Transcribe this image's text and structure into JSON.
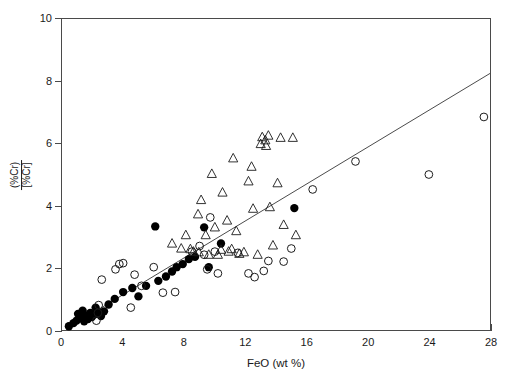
{
  "chart_data": {
    "type": "scatter",
    "title": "",
    "xlabel": "FeO (wt %)",
    "ylabel_numerator": "(%Cr)",
    "ylabel_denominator": "[%Cr]",
    "xlim": [
      0,
      28
    ],
    "ylim": [
      0,
      10
    ],
    "xticks": [
      0,
      4,
      8,
      12,
      16,
      20,
      24,
      28
    ],
    "yticks": [
      0,
      2,
      4,
      6,
      8,
      10
    ],
    "xticklabels": [
      "0",
      "4",
      "8",
      "12",
      "16",
      "20",
      "24",
      "28"
    ],
    "yticklabels": [
      "0",
      "2",
      "4",
      "6",
      "8",
      "10"
    ],
    "grid": false,
    "legend": "none",
    "series": [
      {
        "name": "filled-circle",
        "marker": "filled-circle",
        "color": "#000000",
        "points": [
          [
            0.45,
            0.12
          ],
          [
            0.75,
            0.22
          ],
          [
            0.95,
            0.3
          ],
          [
            1.05,
            0.52
          ],
          [
            1.25,
            0.38
          ],
          [
            1.35,
            0.62
          ],
          [
            1.45,
            0.28
          ],
          [
            1.55,
            0.46
          ],
          [
            1.7,
            0.35
          ],
          [
            1.85,
            0.55
          ],
          [
            1.95,
            0.42
          ],
          [
            2.1,
            0.5
          ],
          [
            2.2,
            0.72
          ],
          [
            2.35,
            0.58
          ],
          [
            2.55,
            0.45
          ],
          [
            2.75,
            0.6
          ],
          [
            3.05,
            0.82
          ],
          [
            3.45,
            1.0
          ],
          [
            4.0,
            1.22
          ],
          [
            4.6,
            1.35
          ],
          [
            5.0,
            1.08
          ],
          [
            5.5,
            1.42
          ],
          [
            6.1,
            3.33
          ],
          [
            6.3,
            1.58
          ],
          [
            6.8,
            1.72
          ],
          [
            7.2,
            1.88
          ],
          [
            7.5,
            2.02
          ],
          [
            7.9,
            2.12
          ],
          [
            8.3,
            2.28
          ],
          [
            8.7,
            2.35
          ],
          [
            9.3,
            3.3
          ],
          [
            9.6,
            2.02
          ],
          [
            10.4,
            2.78
          ],
          [
            15.2,
            3.92
          ]
        ]
      },
      {
        "name": "open-circle",
        "marker": "open-circle",
        "color": "#1a1a1a",
        "points": [
          [
            2.25,
            0.3
          ],
          [
            2.35,
            0.55
          ],
          [
            2.4,
            0.8
          ],
          [
            2.6,
            1.62
          ],
          [
            3.5,
            1.95
          ],
          [
            3.75,
            2.12
          ],
          [
            4.0,
            2.15
          ],
          [
            4.5,
            0.72
          ],
          [
            4.75,
            1.78
          ],
          [
            5.2,
            1.42
          ],
          [
            6.0,
            2.02
          ],
          [
            6.6,
            1.2
          ],
          [
            7.4,
            1.22
          ],
          [
            8.5,
            2.52
          ],
          [
            9.0,
            2.7
          ],
          [
            9.3,
            2.42
          ],
          [
            9.5,
            1.95
          ],
          [
            9.7,
            3.62
          ],
          [
            10.0,
            2.52
          ],
          [
            10.2,
            1.82
          ],
          [
            11.5,
            2.48
          ],
          [
            12.2,
            1.82
          ],
          [
            12.6,
            1.7
          ],
          [
            13.2,
            1.9
          ],
          [
            13.5,
            2.22
          ],
          [
            14.5,
            2.2
          ],
          [
            15.0,
            2.62
          ],
          [
            16.4,
            4.52
          ],
          [
            19.2,
            5.42
          ],
          [
            24.0,
            5.0
          ],
          [
            27.6,
            6.85
          ]
        ]
      },
      {
        "name": "open-triangle",
        "marker": "open-triangle",
        "color": "#1a1a1a",
        "points": [
          [
            7.2,
            2.78
          ],
          [
            7.8,
            2.62
          ],
          [
            8.1,
            3.05
          ],
          [
            8.4,
            2.6
          ],
          [
            8.6,
            2.52
          ],
          [
            8.9,
            3.72
          ],
          [
            8.95,
            2.5
          ],
          [
            9.1,
            4.18
          ],
          [
            9.4,
            3.05
          ],
          [
            9.6,
            2.42
          ],
          [
            9.8,
            5.02
          ],
          [
            10.0,
            3.3
          ],
          [
            10.2,
            2.42
          ],
          [
            10.4,
            2.58
          ],
          [
            10.5,
            4.42
          ],
          [
            10.8,
            3.52
          ],
          [
            10.9,
            2.52
          ],
          [
            11.1,
            2.6
          ],
          [
            11.2,
            5.52
          ],
          [
            11.4,
            3.18
          ],
          [
            11.6,
            2.45
          ],
          [
            11.9,
            2.5
          ],
          [
            12.2,
            4.78
          ],
          [
            12.4,
            5.25
          ],
          [
            12.5,
            3.9
          ],
          [
            12.8,
            2.42
          ],
          [
            13.0,
            5.98
          ],
          [
            13.1,
            6.2
          ],
          [
            13.3,
            6.1
          ],
          [
            13.35,
            5.92
          ],
          [
            13.5,
            6.25
          ],
          [
            13.6,
            3.95
          ],
          [
            13.8,
            2.72
          ],
          [
            14.1,
            4.72
          ],
          [
            14.3,
            6.18
          ],
          [
            14.5,
            3.38
          ],
          [
            15.1,
            6.18
          ],
          [
            15.3,
            3.05
          ]
        ]
      }
    ],
    "trendline": {
      "name": "regression-line",
      "color": "#4a4a4a",
      "x_start": 0.5,
      "y_start": 0.1,
      "x_end": 28.0,
      "y_end": 8.25
    }
  }
}
